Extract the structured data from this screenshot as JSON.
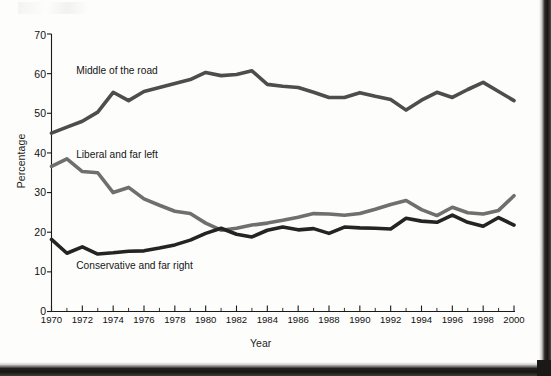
{
  "chart_data": {
    "type": "line",
    "title": "",
    "xlabel": "Year",
    "ylabel": "Percentage",
    "xlim": [
      1970,
      2000
    ],
    "ylim": [
      0,
      70
    ],
    "ytick_labels": [
      "0",
      "10",
      "20",
      "30",
      "40",
      "50",
      "60",
      "70"
    ],
    "ytick_values": [
      0,
      10,
      20,
      30,
      40,
      50,
      60,
      70
    ],
    "xtick_labels": [
      "1970",
      "1972",
      "1974",
      "1976",
      "1978",
      "1980",
      "1982",
      "1984",
      "1986",
      "1988",
      "1990",
      "1992",
      "1994",
      "1996",
      "1998",
      "2000"
    ],
    "xtick_values": [
      1970,
      1972,
      1974,
      1976,
      1978,
      1980,
      1982,
      1984,
      1986,
      1988,
      1990,
      1992,
      1994,
      1996,
      1998,
      2000
    ],
    "minor_xticks_every": 1,
    "grid": false,
    "legend_position": "inline-annotations",
    "x": [
      1970,
      1971,
      1972,
      1973,
      1974,
      1975,
      1976,
      1977,
      1978,
      1979,
      1980,
      1981,
      1982,
      1983,
      1984,
      1985,
      1986,
      1987,
      1988,
      1989,
      1990,
      1991,
      1992,
      1993,
      1994,
      1995,
      1996,
      1997,
      1998,
      1999,
      2000
    ],
    "series": [
      {
        "name": "Middle of the road",
        "color": "#4d4d4d",
        "values": [
          45.0,
          46.5,
          48.0,
          50.3,
          55.3,
          53.2,
          55.5,
          56.5,
          57.5,
          58.5,
          60.3,
          59.5,
          59.8,
          60.7,
          57.3,
          56.8,
          56.5,
          55.3,
          54.0,
          54.0,
          55.2,
          54.3,
          53.5,
          50.8,
          53.3,
          55.3,
          54.0,
          56.0,
          57.8,
          55.5,
          53.2
        ],
        "label_x": 1971.6,
        "label_y": 60.6
      },
      {
        "name": "Liberal and far left",
        "color": "#6f6f6f",
        "values": [
          36.6,
          38.5,
          35.3,
          35.0,
          30.0,
          31.3,
          28.4,
          26.8,
          25.3,
          24.7,
          22.3,
          20.5,
          21.0,
          21.8,
          22.3,
          23.0,
          23.8,
          24.7,
          24.6,
          24.3,
          24.7,
          25.8,
          27.0,
          28.0,
          25.7,
          24.2,
          26.3,
          24.9,
          24.6,
          25.5,
          29.2
        ],
        "label_x": 1971.6,
        "label_y": 39.4
      },
      {
        "name": "Conservative and far right",
        "color": "#242424",
        "values": [
          18.2,
          14.7,
          16.3,
          14.5,
          14.8,
          15.2,
          15.3,
          16.0,
          16.8,
          18.0,
          19.7,
          21.0,
          19.5,
          18.8,
          20.5,
          21.3,
          20.6,
          20.9,
          19.7,
          21.3,
          21.1,
          21.0,
          20.8,
          23.5,
          22.8,
          22.5,
          24.3,
          22.5,
          21.5,
          23.7,
          21.8
        ],
        "label_x": 1971.6,
        "label_y": 11.4
      }
    ]
  }
}
